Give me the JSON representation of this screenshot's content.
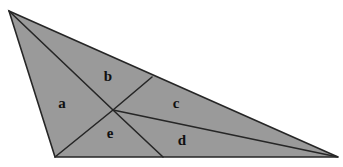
{
  "figure": {
    "name": "subdivided-triangle",
    "background_color": "#ffffff",
    "fill_color": "#9a9a9a",
    "stroke_color": "#262626",
    "label_color": "#101010",
    "stroke_width": 1.6,
    "canvas": {
      "width": 343,
      "height": 167
    },
    "vertices": {
      "apex": {
        "x": 9,
        "y": 11
      },
      "bottom_left": {
        "x": 55,
        "y": 157
      },
      "right": {
        "x": 338,
        "y": 157
      }
    },
    "interior_point": {
      "x": 113,
      "y": 110
    },
    "edge_points": {
      "top_edge_point": {
        "x": 152,
        "y": 77
      },
      "bottom_edge_point": {
        "x": 163,
        "y": 157
      }
    },
    "cevians": [
      {
        "name": "center-to-apex",
        "from": "interior_point",
        "to": "apex"
      },
      {
        "name": "center-to-bottom-left",
        "from": "interior_point",
        "to": "bottom_left"
      },
      {
        "name": "center-to-top-edge",
        "from": "interior_point",
        "to": "top_edge_point"
      },
      {
        "name": "center-to-bottom-edge",
        "from": "interior_point",
        "to": "bottom_edge_point"
      },
      {
        "name": "center-to-right",
        "from": "interior_point",
        "to": "right"
      }
    ],
    "regions": [
      {
        "id": "a",
        "label": "a",
        "label_x": 62,
        "label_y": 105
      },
      {
        "id": "b",
        "label": "b",
        "label_x": 108,
        "label_y": 78
      },
      {
        "id": "c",
        "label": "c",
        "label_x": 176,
        "label_y": 105
      },
      {
        "id": "d",
        "label": "d",
        "label_x": 182,
        "label_y": 142
      },
      {
        "id": "e",
        "label": "e",
        "label_x": 110,
        "label_y": 135
      }
    ]
  }
}
